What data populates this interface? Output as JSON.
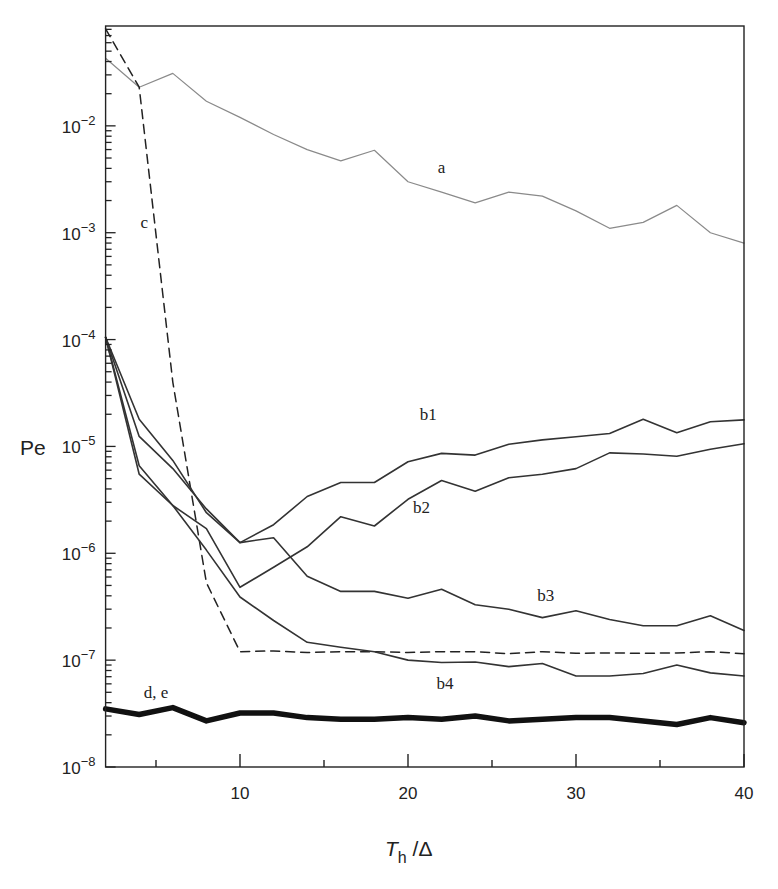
{
  "chart_data": {
    "type": "line",
    "title": "",
    "xlabel": "T_h /Δ",
    "xlabel_parts": {
      "main": "T",
      "sub": "h",
      "rest": " /Δ"
    },
    "ylabel": "Pe",
    "yscale": "log",
    "xlim": [
      2,
      40
    ],
    "ylim": [
      1e-08,
      0.086
    ],
    "grid": false,
    "legend": "none (curves labeled inline)",
    "x_ticks_major": [
      10,
      20,
      30,
      40
    ],
    "x_ticks_minor": [
      5,
      15,
      25,
      35
    ],
    "y_ticks": [
      {
        "value": 1e-08,
        "label_base": "10",
        "label_exp": "−8"
      },
      {
        "value": 1e-07,
        "label_base": "10",
        "label_exp": "−7"
      },
      {
        "value": 1e-06,
        "label_base": "10",
        "label_exp": "−6"
      },
      {
        "value": 1e-05,
        "label_base": "10",
        "label_exp": "−5"
      },
      {
        "value": 0.0001,
        "label_base": "10",
        "label_exp": "−4"
      },
      {
        "value": 0.001,
        "label_base": "10",
        "label_exp": "−3"
      },
      {
        "value": 0.01,
        "label_base": "10",
        "label_exp": "−2"
      }
    ],
    "x": [
      2,
      4,
      6,
      8,
      10,
      12,
      14,
      16,
      18,
      20,
      22,
      24,
      26,
      28,
      30,
      32,
      34,
      36,
      38,
      40
    ],
    "series": [
      {
        "name": "a",
        "style": "thin gray solid",
        "color": "#8a8a8a",
        "values": [
          0.043,
          0.023,
          0.031,
          0.017,
          0.012,
          0.0083,
          0.006,
          0.0047,
          0.0059,
          0.003,
          0.0024,
          0.0019,
          0.0024,
          0.0022,
          0.0016,
          0.0011,
          0.00125,
          0.0018,
          0.001,
          0.0008
        ],
        "label_pos": [
          22,
          0.0036
        ]
      },
      {
        "name": "c",
        "style": "dashed",
        "color": "#222222",
        "values": [
          0.081,
          0.023,
          4e-05,
          5.3e-07,
          1.2e-07,
          1.22e-07,
          1.18e-07,
          1.2e-07,
          1.2e-07,
          1.18e-07,
          1.2e-07,
          1.2e-07,
          1.15e-07,
          1.2e-07,
          1.16e-07,
          1.17e-07,
          1.16e-07,
          1.17e-07,
          1.2e-07,
          1.15e-07
        ],
        "label_pos": [
          4.3,
          0.0011
        ]
      },
      {
        "name": "b1",
        "style": "solid",
        "color": "#333333",
        "values": [
          0.000105,
          1.8e-05,
          7.4e-06,
          2.4e-06,
          1.26e-06,
          1.85e-06,
          3.4e-06,
          4.6e-06,
          4.6e-06,
          7.2e-06,
          8.6e-06,
          8.3e-06,
          1.05e-05,
          1.15e-05,
          1.23e-05,
          1.32e-05,
          1.8e-05,
          1.34e-05,
          1.7e-05,
          1.77e-05
        ],
        "label_pos": [
          21.2,
          1.75e-05
        ]
      },
      {
        "name": "b2",
        "style": "solid",
        "color": "#333333",
        "values": [
          0.000105,
          6.6e-06,
          2.8e-06,
          1.7e-06,
          4.8e-07,
          7.4e-07,
          1.15e-06,
          2.2e-06,
          1.8e-06,
          3.2e-06,
          4.8e-06,
          3.8e-06,
          5.1e-06,
          5.5e-06,
          6.2e-06,
          8.7e-06,
          8.5e-06,
          8.1e-06,
          9.4e-06,
          1.06e-05
        ],
        "label_pos": [
          20.8,
          2.4e-06
        ]
      },
      {
        "name": "b3",
        "style": "solid",
        "color": "#333333",
        "values": [
          0.000105,
          1.24e-05,
          6.2e-06,
          2.6e-06,
          1.26e-06,
          1.4e-06,
          6.1e-07,
          4.4e-07,
          4.4e-07,
          3.8e-07,
          4.6e-07,
          3.3e-07,
          3e-07,
          2.5e-07,
          2.9e-07,
          2.4e-07,
          2.1e-07,
          2.1e-07,
          2.6e-07,
          1.9e-07
        ],
        "label_pos": [
          28.2,
          3.6e-07
        ]
      },
      {
        "name": "b4",
        "style": "solid",
        "color": "#333333",
        "values": [
          0.000105,
          5.5e-06,
          2.8e-06,
          1.07e-06,
          3.9e-07,
          2.35e-07,
          1.47e-07,
          1.32e-07,
          1.2e-07,
          1e-07,
          9.5e-08,
          9.6e-08,
          8.7e-08,
          9.3e-08,
          7.1e-08,
          7.1e-08,
          7.5e-08,
          9e-08,
          7.6e-08,
          7.1e-08
        ],
        "label_pos": [
          22.2,
          5.4e-08
        ]
      },
      {
        "name": "d, e",
        "style": "thick solid",
        "color": "#111111",
        "values": [
          3.5e-08,
          3.1e-08,
          3.6e-08,
          2.7e-08,
          3.2e-08,
          3.2e-08,
          2.9e-08,
          2.8e-08,
          2.8e-08,
          2.9e-08,
          2.8e-08,
          3e-08,
          2.7e-08,
          2.8e-08,
          2.9e-08,
          2.9e-08,
          2.7e-08,
          2.5e-08,
          2.9e-08,
          2.6e-08
        ],
        "label_pos": [
          5.0,
          4.4e-08
        ]
      }
    ]
  }
}
